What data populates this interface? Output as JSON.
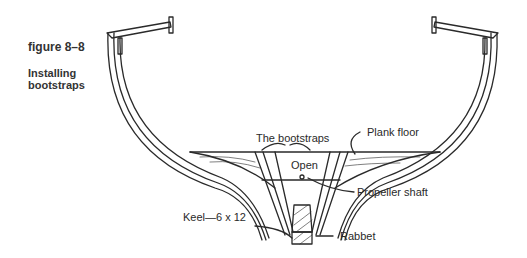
{
  "figure": {
    "number": "figure 8–8",
    "title": "Installing bootstraps"
  },
  "labels": {
    "bootstraps": "The bootstraps",
    "plank_floor": "Plank floor",
    "open": "Open",
    "propeller_shaft": "Propeller shaft",
    "keel": "Keel—6 x 12",
    "rabbet": "Rabbet"
  },
  "colors": {
    "line": "#2a2a2a",
    "background": "#ffffff"
  }
}
